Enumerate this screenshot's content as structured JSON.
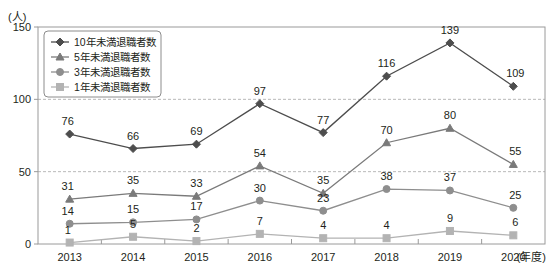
{
  "chart_data": {
    "type": "line",
    "title": "",
    "xlabel": "(年度)",
    "ylabel": "(人)",
    "ylim": [
      0,
      150
    ],
    "yticks": [
      0,
      50,
      100,
      150
    ],
    "grid": "dashed horizontal gridlines at 50 and 100",
    "legend_position": "upper-left inside plot",
    "categories": [
      "2013",
      "2014",
      "2015",
      "2016",
      "2017",
      "2018",
      "2019",
      "2020"
    ],
    "series": [
      {
        "name": "10年未満退職者数",
        "marker": "diamond",
        "color": "#4d4d4d",
        "values": [
          76,
          66,
          69,
          97,
          77,
          116,
          139,
          109
        ]
      },
      {
        "name": "5年未満退職者数",
        "marker": "triangle",
        "color": "#7a7a7a",
        "values": [
          31,
          35,
          33,
          54,
          35,
          70,
          80,
          55
        ]
      },
      {
        "name": "3年未満退職者数",
        "marker": "circle",
        "color": "#8e8e8e",
        "values": [
          14,
          15,
          17,
          30,
          23,
          38,
          37,
          25
        ]
      },
      {
        "name": "1年未満退職者数",
        "marker": "square",
        "color": "#b3b3b3",
        "values": [
          1,
          5,
          2,
          7,
          4,
          4,
          9,
          6
        ]
      }
    ]
  },
  "axis": {
    "unit_label": "(人)",
    "x_unit_label": "(年度)"
  },
  "colors": {
    "series1": "#4d4d4d",
    "series2": "#7a7a7a",
    "series3": "#8e8e8e",
    "series4": "#b3b3b3",
    "grid": "#b9b9b9",
    "border": "#9a9a9a",
    "text": "#231f20"
  }
}
